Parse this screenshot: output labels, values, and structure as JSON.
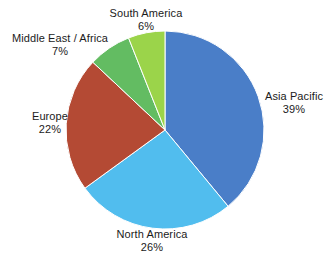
{
  "chart_data": {
    "type": "pie",
    "title": "",
    "subtitle": "",
    "xlabel": "",
    "ylabel": "",
    "legend": "none",
    "grid": false,
    "units": "percent",
    "start_angle_deg": 0,
    "direction": "clockwise",
    "categories": [
      "Asia Pacific",
      "North America",
      "Europe",
      "Middle East / Africa",
      "South America"
    ],
    "values": [
      39,
      26,
      22,
      7,
      6
    ],
    "colors": [
      "#4a7ec8",
      "#51bdee",
      "#b44a34",
      "#63bc62",
      "#9bd44a"
    ],
    "slices": [
      {
        "label": "Asia Pacific",
        "value": 39,
        "value_text": "39%",
        "color": "#4a7ec8",
        "label_position": "right"
      },
      {
        "label": "North America",
        "value": 26,
        "value_text": "26%",
        "color": "#51bdee",
        "label_position": "bottom"
      },
      {
        "label": "Europe",
        "value": 22,
        "value_text": "22%",
        "color": "#b44a34",
        "label_position": "left"
      },
      {
        "label": "Middle East / Africa",
        "value": 7,
        "value_text": "7%",
        "color": "#63bc62",
        "label_position": "top-left"
      },
      {
        "label": "South America",
        "value": 6,
        "value_text": "6%",
        "color": "#9bd44a",
        "label_position": "top"
      }
    ],
    "total": 100,
    "background_color": "#ffffff",
    "label_text_color": "#1b1b1b"
  },
  "labels": {
    "asia_pacific": {
      "name": "Asia Pacific",
      "value": "39%"
    },
    "north_america": {
      "name": "North America",
      "value": "26%"
    },
    "europe": {
      "name": "Europe",
      "value": "22%"
    },
    "middle_east_africa": {
      "name": "Middle East / Africa",
      "value": "7%"
    },
    "south_america": {
      "name": "South America",
      "value": "6%"
    }
  }
}
